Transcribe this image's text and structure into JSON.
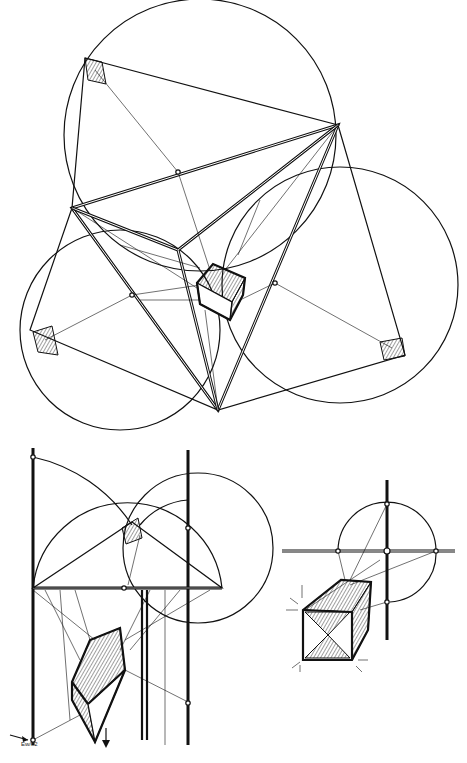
{
  "figure": {
    "stroke_color": "#111111",
    "background": "#ffffff"
  },
  "top_diagram": {
    "name": "three-point-perspective-construction",
    "triangle_vertices": [
      [
        72,
        208
      ],
      [
        338,
        125
      ],
      [
        218,
        410
      ]
    ],
    "circles": [
      {
        "cx": 200,
        "cy": 132,
        "r": 135
      },
      {
        "cx": 122,
        "cy": 330,
        "r": 100
      },
      {
        "cx": 338,
        "cy": 280,
        "r": 118
      }
    ],
    "center": [
      178,
      250
    ]
  },
  "bottom_left": {
    "name": "two-point-perspective-construction"
  },
  "bottom_right": {
    "name": "cube-construction-detail"
  },
  "signature": "Ew/82"
}
